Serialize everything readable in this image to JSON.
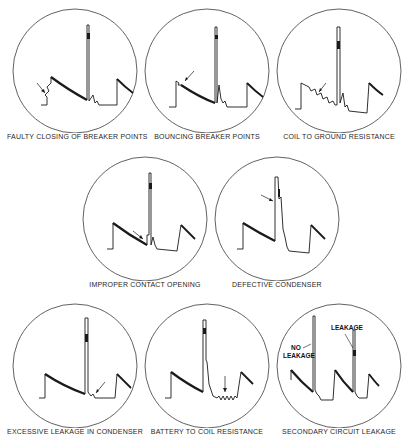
{
  "diagram": {
    "type": "oscilloscope-ignition-patterns",
    "panels": [
      {
        "id": "faulty-closing",
        "caption": "FAULTY CLOSING OF BREAKER POINTS",
        "row": 1,
        "col": 1
      },
      {
        "id": "bouncing-points",
        "caption": "BOUNCING BREAKER POINTS",
        "row": 1,
        "col": 2
      },
      {
        "id": "coil-to-ground",
        "caption": "COIL TO GROUND RESISTANCE",
        "row": 1,
        "col": 3
      },
      {
        "id": "improper-contact",
        "caption": "IMPROPER CONTACT OPENING",
        "row": 2,
        "col": 1
      },
      {
        "id": "defective-condenser",
        "caption": "DEFECTIVE CONDENSER",
        "row": 2,
        "col": 2
      },
      {
        "id": "excessive-leakage",
        "caption": "EXCESSIVE LEAKAGE IN CONDENSER",
        "row": 3,
        "col": 1
      },
      {
        "id": "battery-to-coil",
        "caption": "BATTERY TO COIL RESISTANCE",
        "row": 3,
        "col": 2
      },
      {
        "id": "secondary-leakage",
        "caption": "SECONDARY CIRCUIT LEAKAGE",
        "row": 3,
        "col": 3
      }
    ],
    "annotations": {
      "no_leakage": "NO LEAKAGE",
      "no_leakage_line1": "NO",
      "no_leakage_line2": "LEAKAGE",
      "leakage": "LEAKAGE"
    },
    "colors": {
      "trace": "#1a1a1a",
      "circle": "#3a3a3a",
      "background": "#ffffff"
    }
  }
}
